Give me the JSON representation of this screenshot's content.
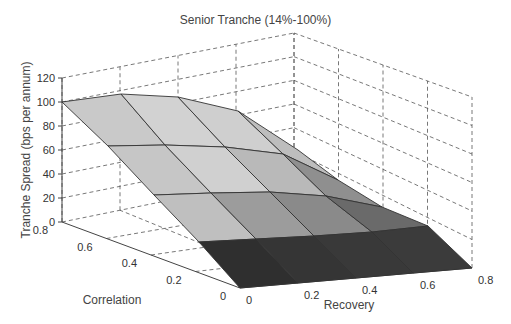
{
  "header": {
    "cut_caption": "Figure ... Senior Tranche ... (2005), p."
  },
  "chart_data": {
    "type": "surface3d",
    "title": "Senior Tranche (14%-100%)",
    "xlabel": "Recovery",
    "ylabel": "Correlation",
    "zlabel": "Tranche Spread (bps per annum)",
    "x_ticks": [
      "0",
      "0.2",
      "0.4",
      "0.6",
      "0.8"
    ],
    "y_ticks": [
      "0",
      "0.2",
      "0.4",
      "0.6",
      "0.8"
    ],
    "z_ticks": [
      "0",
      "20",
      "40",
      "60",
      "80",
      "100",
      "120"
    ],
    "xlim": [
      0,
      0.8
    ],
    "ylim": [
      0,
      0.8
    ],
    "zlim": [
      0,
      120
    ],
    "grid": true,
    "recovery": [
      0,
      0.2,
      0.4,
      0.6,
      0.8
    ],
    "correlation": [
      0,
      0.2,
      0.4,
      0.6,
      0.8
    ],
    "z_values_by_correlation": [
      {
        "correlation": 0,
        "values": [
          0,
          0,
          0,
          0,
          0
        ]
      },
      {
        "correlation": 0.2,
        "values": [
          20,
          20,
          19,
          16,
          10
        ]
      },
      {
        "correlation": 0.4,
        "values": [
          48,
          48,
          46,
          40,
          28
        ]
      },
      {
        "correlation": 0.6,
        "values": [
          74,
          74,
          71,
          63,
          45
        ]
      },
      {
        "correlation": 0.8,
        "values": [
          100,
          101,
          98,
          88,
          65
        ]
      }
    ]
  },
  "render": {
    "axis_box": {
      "front_floor": [
        240,
        288
      ],
      "left_floor": [
        62,
        222
      ],
      "right_floor": [
        472,
        268
      ],
      "back_floor": [
        294,
        175
      ],
      "left_top": [
        62,
        78
      ],
      "back_top": [
        294,
        33
      ],
      "right_top": [
        472,
        97
      ]
    },
    "vertex_rows": [
      [
        [
          62,
          102
        ],
        [
          121,
          94
        ],
        [
          178,
          97
        ],
        [
          238,
          111
        ],
        [
          298,
          150
        ]
      ],
      [
        [
          108,
          146
        ],
        [
          165,
          145
        ],
        [
          225,
          147
        ],
        [
          283,
          154
        ],
        [
          338,
          180
        ]
      ],
      [
        [
          154,
          195
        ],
        [
          211,
          193
        ],
        [
          270,
          192
        ],
        [
          326,
          196
        ],
        [
          382,
          207
        ]
      ],
      [
        [
          199,
          242
        ],
        [
          256,
          239
        ],
        [
          314,
          236
        ],
        [
          372,
          232
        ],
        [
          428,
          226
        ]
      ],
      [
        [
          240,
          288
        ],
        [
          298,
          283
        ],
        [
          356,
          278
        ],
        [
          413,
          273
        ],
        [
          472,
          268
        ]
      ]
    ],
    "cell_fills": [
      [
        "#c9c9c9",
        "#d2d2d2",
        "#cfcfcf",
        "#bdbdbd"
      ],
      [
        "#c6c6c6",
        "#d0d0d0",
        "#b9b9b9",
        "#8f8f8f"
      ],
      [
        "#bfbfbf",
        "#9c9c9c",
        "#8a8a8a",
        "#6a6a6a"
      ],
      [
        "#2f2f2f",
        "#353535",
        "#393939",
        "#3b3b3b"
      ]
    ],
    "colors": {
      "edge": "#333333",
      "grid": "#555555",
      "axis": "#444444"
    }
  }
}
